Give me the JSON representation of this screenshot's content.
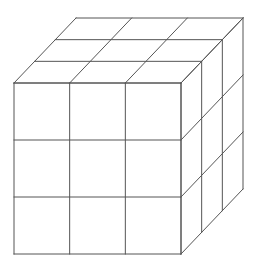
{
  "diagram": {
    "type": "cube-grid",
    "grid_size": 3,
    "visible_faces": [
      "front",
      "top",
      "right"
    ],
    "line_color": "#555555",
    "background": "#ffffff",
    "front_face": {
      "x0": 14,
      "y0": 83,
      "x1": 181,
      "y1": 254
    },
    "depth_offset": {
      "dx": 62,
      "dy": -65
    }
  }
}
